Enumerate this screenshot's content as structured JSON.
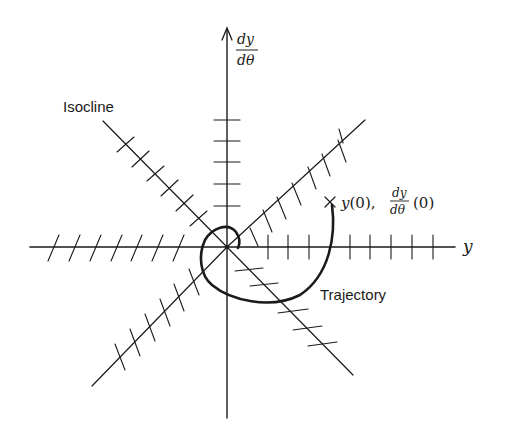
{
  "figure": {
    "type": "phase-plane isocline diagram",
    "colors": {
      "ink": "#1a1a1a",
      "background": "#ffffff"
    }
  },
  "axes": {
    "x_label": "y",
    "y_label_numerator": "dy",
    "y_label_denominator": "dθ"
  },
  "labels": {
    "isocline": "Isocline",
    "trajectory": "Trajectory",
    "initial_point_prefix": "y(0),",
    "initial_point_frac_num": "dy",
    "initial_point_frac_den": "dθ",
    "initial_point_suffix": "(0)",
    "initial_marker": "×"
  },
  "isoclines": [
    {
      "name": "horizontal-axis-right",
      "slope_marks": "vertical",
      "count": 9
    },
    {
      "name": "horizontal-axis-left",
      "slope_marks": "slanted",
      "count": 8
    },
    {
      "name": "vertical-axis-upper",
      "slope_marks": "horizontal",
      "count": 5
    },
    {
      "name": "diagonal-upper-right",
      "slope_marks": "steep",
      "count": 7
    },
    {
      "name": "diagonal-upper-left",
      "slope_marks": "shallow",
      "count": 6
    },
    {
      "name": "diagonal-lower-left",
      "slope_marks": "steep",
      "count": 6
    },
    {
      "name": "diagonal-lower-right",
      "slope_marks": "shallow",
      "count": 5
    }
  ]
}
